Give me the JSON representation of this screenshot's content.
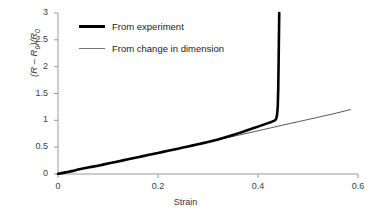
{
  "chart_data": {
    "type": "line",
    "title": "",
    "xlabel": "Strain",
    "ylabel": "(R – R₀)/R₀",
    "xlim": [
      0,
      0.6
    ],
    "ylim": [
      0,
      3
    ],
    "xticks": [
      "0",
      "0.2",
      "0.4",
      "0.6"
    ],
    "xtick_values": [
      0,
      0.2,
      0.4,
      0.6
    ],
    "yticks": [
      "0",
      "0.5",
      "1",
      "1.5",
      "2",
      "2.5",
      "3"
    ],
    "ytick_values": [
      0,
      0.5,
      1,
      1.5,
      2,
      2.5,
      3
    ],
    "grid": false,
    "legend_position": "upper-left-inside",
    "series": [
      {
        "name": "From experiment",
        "color": "#000000",
        "width": 2.6,
        "points": [
          [
            0.0,
            0.005
          ],
          [
            0.005,
            0.012
          ],
          [
            0.01,
            0.021
          ],
          [
            0.015,
            0.03
          ],
          [
            0.02,
            0.039
          ],
          [
            0.025,
            0.049
          ],
          [
            0.03,
            0.058
          ],
          [
            0.035,
            0.07
          ],
          [
            0.04,
            0.082
          ],
          [
            0.045,
            0.095
          ],
          [
            0.05,
            0.104
          ],
          [
            0.06,
            0.12
          ],
          [
            0.07,
            0.137
          ],
          [
            0.08,
            0.155
          ],
          [
            0.09,
            0.175
          ],
          [
            0.1,
            0.195
          ],
          [
            0.11,
            0.214
          ],
          [
            0.12,
            0.234
          ],
          [
            0.13,
            0.254
          ],
          [
            0.14,
            0.274
          ],
          [
            0.15,
            0.294
          ],
          [
            0.16,
            0.313
          ],
          [
            0.17,
            0.333
          ],
          [
            0.18,
            0.353
          ],
          [
            0.19,
            0.373
          ],
          [
            0.2,
            0.392
          ],
          [
            0.21,
            0.412
          ],
          [
            0.22,
            0.432
          ],
          [
            0.23,
            0.452
          ],
          [
            0.24,
            0.472
          ],
          [
            0.25,
            0.493
          ],
          [
            0.26,
            0.513
          ],
          [
            0.27,
            0.533
          ],
          [
            0.28,
            0.554
          ],
          [
            0.29,
            0.575
          ],
          [
            0.3,
            0.597
          ],
          [
            0.31,
            0.62
          ],
          [
            0.32,
            0.644
          ],
          [
            0.33,
            0.67
          ],
          [
            0.34,
            0.698
          ],
          [
            0.35,
            0.727
          ],
          [
            0.36,
            0.757
          ],
          [
            0.37,
            0.788
          ],
          [
            0.38,
            0.819
          ],
          [
            0.39,
            0.851
          ],
          [
            0.4,
            0.883
          ],
          [
            0.41,
            0.915
          ],
          [
            0.42,
            0.948
          ],
          [
            0.428,
            0.975
          ],
          [
            0.433,
            0.995
          ],
          [
            0.436,
            1.02
          ],
          [
            0.438,
            1.09
          ],
          [
            0.4395,
            1.25
          ],
          [
            0.4405,
            1.6
          ],
          [
            0.4412,
            2.05
          ],
          [
            0.4418,
            2.5
          ],
          [
            0.4422,
            2.8
          ],
          [
            0.4425,
            3.0
          ]
        ]
      },
      {
        "name": "From  change in dimension",
        "color": "#5a5a5a",
        "width": 1.0,
        "points": [
          [
            0.0,
            0.0
          ],
          [
            0.05,
            0.1
          ],
          [
            0.1,
            0.2
          ],
          [
            0.15,
            0.3
          ],
          [
            0.2,
            0.398
          ],
          [
            0.25,
            0.496
          ],
          [
            0.3,
            0.596
          ],
          [
            0.35,
            0.7
          ],
          [
            0.4,
            0.805
          ],
          [
            0.45,
            0.912
          ],
          [
            0.5,
            1.015
          ],
          [
            0.55,
            1.12
          ],
          [
            0.585,
            1.2
          ]
        ]
      }
    ]
  },
  "axes": {
    "x_title": "Strain",
    "y_title_prefix": "(R – R",
    "y_title_sub1": "0",
    "y_title_mid": ")/R",
    "y_title_sub2": "0"
  },
  "legend": {
    "entries": [
      {
        "label": "From experiment",
        "style": "thick"
      },
      {
        "label": "From  change in dimension",
        "style": "thin"
      }
    ]
  },
  "colors": {
    "axis": "#9a9a9a",
    "experiment": "#000000",
    "dimension": "#5a5a5a",
    "text": "#333333",
    "background": "#ffffff"
  }
}
